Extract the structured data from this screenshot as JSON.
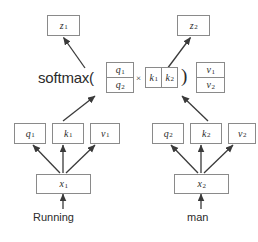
{
  "diagram": {
    "colors": {
      "box_border": "#8a8a8a",
      "text": "#2b2b2b",
      "arrow": "#3a3a3a",
      "background": "#ffffff"
    },
    "formula": {
      "softmax_label": "softmax(",
      "times_symbol": "×",
      "close_paren": ")"
    },
    "outputs": [
      {
        "base": "z",
        "sub": "1",
        "label": "z₁"
      },
      {
        "base": "z",
        "sub": "2",
        "label": "z₂"
      }
    ],
    "q_matrix": {
      "name": "query-matrix",
      "cells": [
        {
          "base": "q",
          "sub": "1"
        },
        {
          "base": "q",
          "sub": "2"
        }
      ]
    },
    "k_matrix": {
      "name": "key-matrix-transposed",
      "cells": [
        {
          "base": "k",
          "sub": "1"
        },
        {
          "base": "k",
          "sub": "2"
        }
      ]
    },
    "v_matrix": {
      "name": "value-matrix",
      "cells": [
        {
          "base": "v",
          "sub": "1"
        },
        {
          "base": "v",
          "sub": "2"
        }
      ]
    },
    "columns": [
      {
        "name": "token-1",
        "word": "Running",
        "input": {
          "base": "x",
          "sub": "1"
        },
        "vectors": [
          {
            "base": "q",
            "sub": "1"
          },
          {
            "base": "k",
            "sub": "1"
          },
          {
            "base": "v",
            "sub": "1"
          }
        ]
      },
      {
        "name": "token-2",
        "word": "man",
        "input": {
          "base": "x",
          "sub": "2"
        },
        "vectors": [
          {
            "base": "q",
            "sub": "2"
          },
          {
            "base": "k",
            "sub": "2"
          },
          {
            "base": "v",
            "sub": "2"
          }
        ]
      }
    ]
  }
}
